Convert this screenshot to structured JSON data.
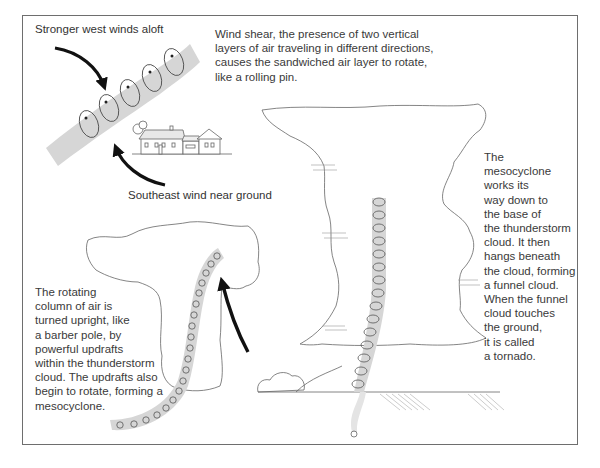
{
  "figure": {
    "labels": {
      "upper_wind": "Stronger west winds aloft",
      "lower_wind": "Southeast wind near ground"
    },
    "captions": {
      "wind_shear": "Wind shear, the presence of two vertical\nlayers of air traveling in different directions,\ncauses the sandwiched air layer to rotate,\nlike a rolling pin.",
      "updraft": "The rotating\ncolumn of air is\nturned upright, like\na barber pole, by\npowerful updrafts\nwithin the thunderstorm\ncloud. The updrafts also\nbegin to rotate, forming a\nmesocyclone.",
      "tornado": "The\nmesocyclone\nworks its\nway down to\nthe base of\nthe thunderstorm\ncloud. It then\nhangs beneath\nthe cloud, forming\na funnel cloud.\nWhen the funnel\ncloud touches\nthe ground,\nit is called\na tornado."
    },
    "stages": [
      {
        "name": "wind-shear",
        "elements": [
          "rolling-air-tube",
          "upper-wind-arrow",
          "lower-wind-arrow",
          "house"
        ]
      },
      {
        "name": "updraft",
        "elements": [
          "thunderstorm-cloud-small",
          "vertical-rotating-column",
          "updraft-arrow"
        ]
      },
      {
        "name": "tornado",
        "elements": [
          "thunderstorm-cloud-large",
          "mesocyclone-column",
          "funnel-touchdown",
          "rain-streaks"
        ]
      }
    ],
    "colors": {
      "text": "#333333",
      "frame": "#6e6e6e",
      "tube": "#d6d6d6",
      "arrow": "#111111",
      "outline": "#555555"
    }
  }
}
